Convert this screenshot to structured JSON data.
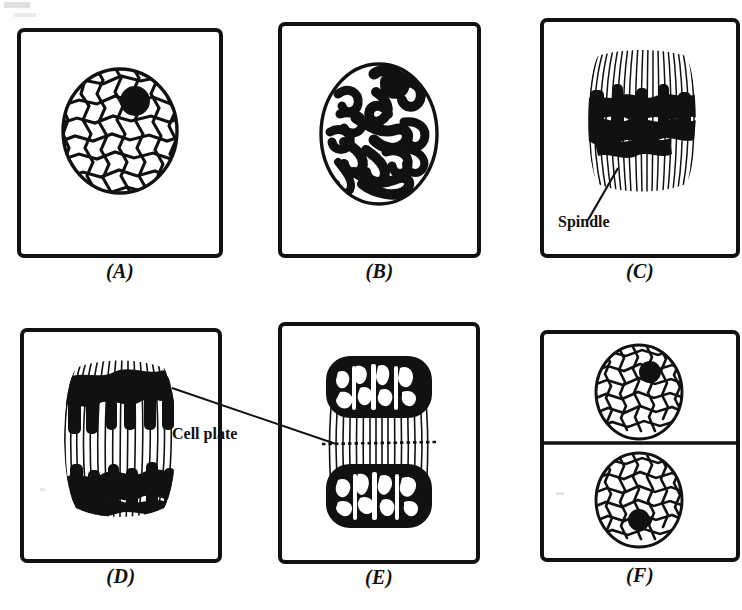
{
  "figure": {
    "background_color": "#fdfdfc",
    "ink_color": "#111111"
  },
  "panels": [
    {
      "id": "A",
      "caption": "(A)",
      "stage": "Resting nucleus (interphase)",
      "content": "reticulate nucleus with nucleolus",
      "has_divider": false
    },
    {
      "id": "B",
      "caption": "(B)",
      "stage": "Prophase",
      "content": "condensed tangled chromosome threads in nuclear envelope",
      "has_divider": false
    },
    {
      "id": "C",
      "caption": "(C)",
      "stage": "Metaphase",
      "content": "spindle with chromosomes at equatorial plate",
      "has_divider": false
    },
    {
      "id": "D",
      "caption": "(D)",
      "stage": "Anaphase",
      "content": "daughter chromosomes moving to poles on spindle",
      "has_divider": false
    },
    {
      "id": "E",
      "caption": "(E)",
      "stage": "Telophase",
      "content": "two daughter nuclei with cell plate forming",
      "has_divider": false
    },
    {
      "id": "F",
      "caption": "(F)",
      "stage": "Two daughter cells",
      "content": "two daughter cells separated by new cell wall",
      "has_divider": true
    }
  ],
  "callouts": [
    {
      "key": "spindle",
      "label": "Spindle",
      "panel": "C"
    },
    {
      "key": "cell_plate",
      "label": "Cell plate",
      "panel": "E"
    }
  ]
}
